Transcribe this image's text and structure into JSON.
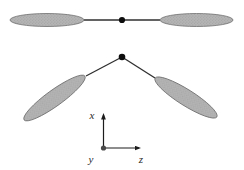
{
  "figure": {
    "colors": {
      "background": "#ffffff",
      "lobe_fill": "#b4b4b4",
      "lobe_speckle": "#999999",
      "lobe_stroke": "#6e6e6e",
      "bond_line": "#2f2f2f",
      "node_fill": "#0d0d0d",
      "axis_line": "#1c1c1c",
      "origin_dot": "#4a4a4a",
      "label_color": "#2a2a2a"
    },
    "linear_configuration": {
      "lobes": [
        {
          "cx": 47,
          "cy": 20,
          "rx": 37,
          "ry": 6.5,
          "rotate": 0
        },
        {
          "cx": 196.5,
          "cy": 20,
          "rx": 36.5,
          "ry": 6.5,
          "rotate": 0
        }
      ],
      "bond": {
        "x1": 84,
        "y1": 20,
        "x2": 160,
        "y2": 20
      },
      "node": {
        "cx": 122,
        "cy": 20,
        "r": 3.1
      }
    },
    "bent_configuration": {
      "node": {
        "cx": 122,
        "cy": 57,
        "r": 3.3
      },
      "bonds": [
        {
          "x1": 122,
          "y1": 57,
          "x2": 86,
          "y2": 76
        },
        {
          "x1": 122,
          "y1": 57,
          "x2": 155,
          "y2": 78
        }
      ],
      "lobes": [
        {
          "cx": 54.5,
          "cy": 98,
          "rx": 37.5,
          "ry": 8,
          "rotate": -35.8
        },
        {
          "cx": 186,
          "cy": 97.5,
          "rx": 36.5,
          "ry": 8,
          "rotate": 32.2
        }
      ]
    },
    "axes": {
      "origin_dot": {
        "cx": 103.5,
        "cy": 148,
        "r": 2.6
      },
      "x_axis": {
        "x1": 103.5,
        "y1": 148,
        "x2": 103.5,
        "y2": 115
      },
      "z_axis": {
        "x1": 103.5,
        "y1": 148,
        "x2": 139,
        "y2": 148
      },
      "x_label": {
        "text": "x",
        "x": 92,
        "y": 119
      },
      "y_label": {
        "text": "y",
        "x": 91,
        "y": 163
      },
      "z_label": {
        "text": "z",
        "x": 141,
        "y": 163
      }
    }
  }
}
